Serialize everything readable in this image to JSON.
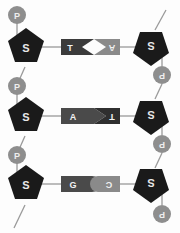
{
  "diagram": {
    "background_color": "#fdfdfd",
    "colors": {
      "sugar": "#1a1a1a",
      "phosphate": "#8e8e8e",
      "base_dark": "#3b3b3b",
      "base_mid": "#555555",
      "base_light": "#8a8a8a",
      "backbone_line": "#9a9a9a",
      "rung_line": "#9a9a9a",
      "label_light": "#ececec"
    },
    "legend": {
      "sugar_symbol": "S",
      "phosphate_symbol": "P"
    },
    "left_strand": {
      "name": "left-strand",
      "orientation": "upright",
      "phosphates": [
        {
          "label": "P"
        },
        {
          "label": "P"
        },
        {
          "label": "P"
        }
      ],
      "sugars": [
        {
          "label": "S"
        },
        {
          "label": "S"
        },
        {
          "label": "S"
        }
      ]
    },
    "right_strand": {
      "name": "right-strand",
      "orientation": "rotated-180",
      "phosphates": [
        {
          "label": "P"
        },
        {
          "label": "P"
        },
        {
          "label": "P"
        }
      ],
      "sugars": [
        {
          "label": "S"
        },
        {
          "label": "S"
        },
        {
          "label": "S"
        }
      ]
    },
    "base_pairs": [
      {
        "left_base": "T",
        "right_base": "A",
        "interlock": "wedge",
        "row": 1
      },
      {
        "left_base": "A",
        "right_base": "T",
        "interlock": "wedge",
        "row": 2
      },
      {
        "left_base": "G",
        "right_base": "C",
        "interlock": "round",
        "row": 3
      }
    ]
  }
}
